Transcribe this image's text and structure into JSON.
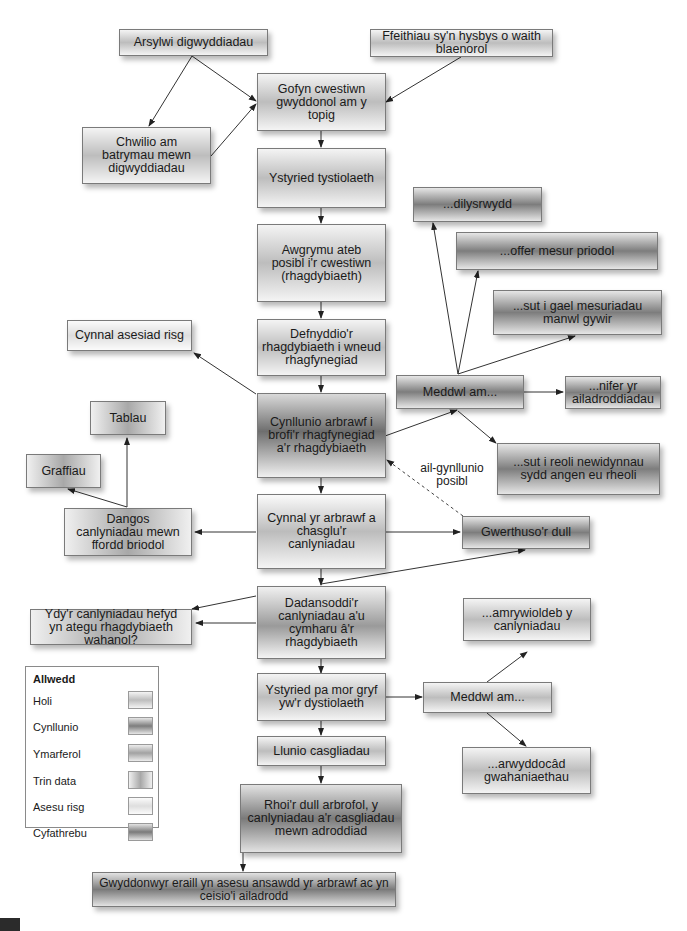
{
  "diagram": {
    "nodes": {
      "arsylwi": "Arsylwi digwyddiadau",
      "ffeithiau": "Ffeithiau sy'n hysbys o waith blaenorol",
      "gofyn": "Gofyn cwestiwn gwyddonol am y topig",
      "chwilio": "Chwilio am batrymau mewn digwyddiadau",
      "ystyried_tyst": "Ystyried tystiolaeth",
      "awgrymu": "Awgrymu ateb posibl i'r cwestiwn (rhagdybiaeth)",
      "defnyddio": "Defnyddio'r rhagdybiaeth i wneud rhagfynegiad",
      "cynnal_risg": "Cynnal asesiad risg",
      "cynllunio": "Cynllunio arbrawf i brofi'r rhagfynegiad a'r rhagdybiaeth",
      "meddwl1": "Meddwl am...",
      "dilysrwydd": "...dilysrwydd",
      "offer": "...offer mesur priodol",
      "sut_gael": "...sut i gael mesuriadau manwl gywir",
      "nifer": "...nifer yr ailadroddiadau",
      "sut_reoli": "...sut i reoli newidynnau sydd angen eu rheoli",
      "tablau": "Tablau",
      "graffiau": "Graffiau",
      "dangos": "Dangos canlyniadau mewn ffordd briodol",
      "cynnal_arbrawf": "Cynnal yr arbrawf a chasglu'r canlyniadau",
      "gwerthuso": "Gwerthuso'r dull",
      "ail_gynllunio": "ail-gynllunio posibl",
      "dadansoddi": "Dadansoddi'r canlyniadau a'u cymharu â'r rhagdybiaeth",
      "ydyr": "Ydy'r canlyniadau hefyd yn ategu rhagdybiaeth wahanol?",
      "ystyried_pa": "Ystyried pa mor gryf yw'r dystiolaeth",
      "meddwl2": "Meddwl am...",
      "amrywioldeb": "...amrywioldeb y canlyniadau",
      "arwyddocad": "...arwyddocâd gwahaniaethau",
      "llunio": "Llunio casgliadau",
      "rhoir": "Rhoi'r dull arbrofol, y canlyniadau a'r casgliadau mewn adroddiad",
      "gwyddonwyr": "Gwyddonwyr eraill yn asesu ansawdd yr arbrawf ac yn ceisio'i ailadrodd"
    },
    "legend": {
      "title": "Allwedd",
      "items": [
        {
          "label": "Holi",
          "color": "#c4c4c4"
        },
        {
          "label": "Cynllunio",
          "color": "#7d7d7d"
        },
        {
          "label": "Ymarferol",
          "color": "#a2a2a2"
        },
        {
          "label": "Trin data",
          "color": "#a8a8a8"
        },
        {
          "label": "Asesu risg",
          "color": "#e2e2e2"
        },
        {
          "label": "Cyfathrebu",
          "color": "#7a7a7a"
        }
      ]
    }
  }
}
